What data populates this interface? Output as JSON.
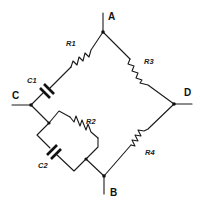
{
  "diagram": {
    "type": "circuit",
    "nodes": [
      {
        "id": "A",
        "label": "A"
      },
      {
        "id": "B",
        "label": "B"
      },
      {
        "id": "C",
        "label": "C"
      },
      {
        "id": "D",
        "label": "D"
      }
    ],
    "components": [
      {
        "id": "R1",
        "label": "R1",
        "kind": "resistor",
        "between": "C-A (series with C1)"
      },
      {
        "id": "C1",
        "label": "C1",
        "kind": "capacitor",
        "between": "C-A (series with R1)"
      },
      {
        "id": "R3",
        "label": "R3",
        "kind": "resistor",
        "between": "A-D"
      },
      {
        "id": "R4",
        "label": "R4",
        "kind": "resistor",
        "between": "B-D"
      },
      {
        "id": "R2",
        "label": "R2",
        "kind": "resistor",
        "between": "C-B (parallel with C2)"
      },
      {
        "id": "C2",
        "label": "C2",
        "kind": "capacitor",
        "between": "C-B (parallel with R2)"
      }
    ],
    "colors": {
      "line": "#1a1a1a",
      "background": "#ffffff"
    }
  }
}
